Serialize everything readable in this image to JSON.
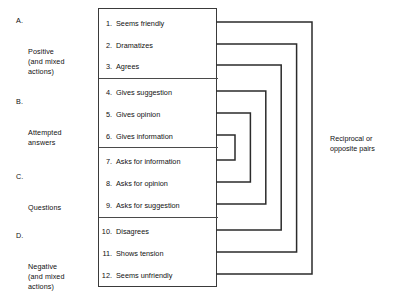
{
  "diagram": {
    "categories": [
      {
        "letter": "A.",
        "lines": "Positive\n(and mixed\nactions)"
      },
      {
        "letter": "B.",
        "lines": "Attempted\nanswers"
      },
      {
        "letter": "C.",
        "lines": "Questions"
      },
      {
        "letter": "D.",
        "lines": "Negative\n(and mixed\nactions)"
      }
    ],
    "items": [
      {
        "num": "1.",
        "text": "Seems friendly"
      },
      {
        "num": "2.",
        "text": "Dramatizes"
      },
      {
        "num": "3.",
        "text": "Agrees"
      },
      {
        "num": "4.",
        "text": "Gives suggestion"
      },
      {
        "num": "5.",
        "text": "Gives opinion"
      },
      {
        "num": "6.",
        "text": "Gives information"
      },
      {
        "num": "7.",
        "text": "Asks for information"
      },
      {
        "num": "8.",
        "text": "Asks for opinion"
      },
      {
        "num": "9.",
        "text": "Asks for suggestion"
      },
      {
        "num": "10.",
        "text": "Disagrees"
      },
      {
        "num": "11.",
        "text": "Shows tension"
      },
      {
        "num": "12.",
        "text": "Seems unfriendly"
      }
    ],
    "pairs_label": "Reciprocal or\nopposite pairs",
    "pairings": [
      {
        "top_item": 1,
        "bottom_item": 12
      },
      {
        "top_item": 2,
        "bottom_item": 11
      },
      {
        "top_item": 3,
        "bottom_item": 10
      },
      {
        "top_item": 4,
        "bottom_item": 9
      },
      {
        "top_item": 5,
        "bottom_item": 8
      },
      {
        "top_item": 6,
        "bottom_item": 7
      }
    ],
    "colors": {
      "line": "#2b2b2b",
      "box_border": "#3a3a3a",
      "text": "#111111",
      "background": "#ffffff"
    }
  }
}
